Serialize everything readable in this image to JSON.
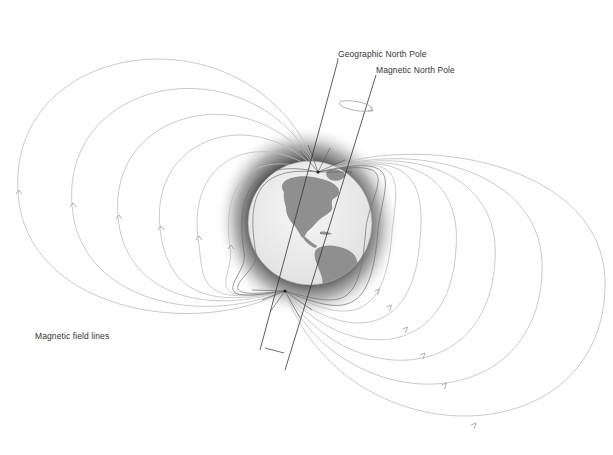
{
  "labels": {
    "geographic_north_pole": "Geographic North Pole",
    "magnetic_north_pole": "Magnetic North Pole",
    "magnetic_field_lines": "Magnetic field lines"
  },
  "colors": {
    "field_line": "#bdbdbd",
    "field_line_inner": "#6e6e6e",
    "globe_ocean": "#ededed",
    "globe_land": "#8f8f8f",
    "glow": "#505050",
    "axis": "#333333",
    "label_text": "#333333"
  },
  "field_line_count_per_side": 6,
  "direction": "field lines run from the southern magnetic pole around to the northern magnetic pole"
}
